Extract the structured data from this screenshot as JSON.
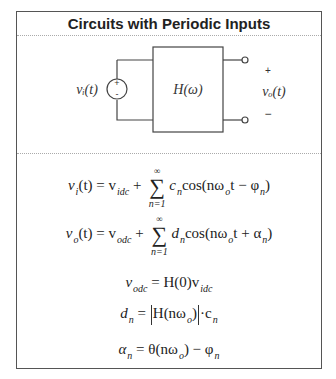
{
  "card": {
    "title": "Circuits with Periodic Inputs"
  },
  "diagram": {
    "source_label": "vᵢ(t)",
    "source_plus": "+",
    "source_minus": "-",
    "system_label": "H(ω)",
    "output_label": "vₒ(t)",
    "output_plus": "+",
    "output_minus": "−"
  },
  "equations": [
    {
      "id": "input-series",
      "lhs": "v",
      "lhs_sub": "i",
      "lhs_arg": "(t) = v",
      "dc_sub": "idc",
      "op": "+",
      "sum_top": "∞",
      "sum_bot": "n=1",
      "coef": "c",
      "coef_sub": "n",
      "cos": "cos(nω",
      "w_sub": "o",
      "tail": "t − φ",
      "tail_sub": "n",
      "close": ")"
    },
    {
      "id": "output-series",
      "lhs": "v",
      "lhs_sub": "o",
      "lhs_arg": "(t) = v",
      "dc_sub": "odc",
      "op": "+",
      "sum_top": "∞",
      "sum_bot": "n=1",
      "coef": "d",
      "coef_sub": "n",
      "cos": "cos(nω",
      "w_sub": "o",
      "tail": "t + α",
      "tail_sub": "n",
      "close": ")"
    },
    {
      "id": "dc-relation",
      "lhs": "v",
      "lhs_sub": "odc",
      "mid": " = H(0)v",
      "mid_sub": "idc"
    },
    {
      "id": "magnitude-relation",
      "lhs": "d",
      "lhs_sub": "n",
      "mid": " = ",
      "h": "H(nω",
      "h_sub": "o",
      "h_close": ")",
      "dot": "·c",
      "dot_sub": "n"
    },
    {
      "id": "phase-relation",
      "lhs": "α",
      "lhs_sub": "n",
      "mid": " = θ(nω",
      "mid_sub": "o",
      "tail": ") − φ",
      "tail_sub": "n"
    }
  ]
}
